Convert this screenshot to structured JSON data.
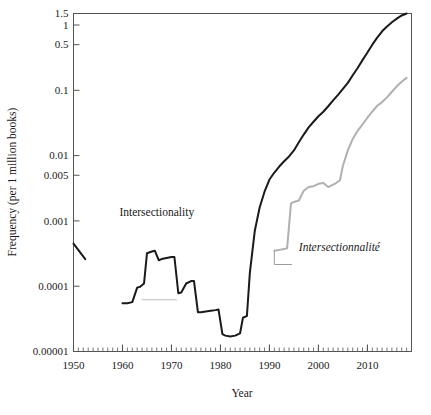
{
  "chart_data": {
    "type": "line",
    "title": "",
    "subtitle": "",
    "xlabel": "Year",
    "ylabel": "Frequency (per 1 million books)",
    "yscale": "log",
    "xlim": [
      1950,
      2019
    ],
    "ylim": [
      1e-05,
      1.5
    ],
    "grid": false,
    "legend_position": "inline-annotations",
    "xticks": [
      "1950",
      "1960",
      "1970",
      "1980",
      "1990",
      "2000",
      "2010"
    ],
    "xtick_values": [
      1950,
      1960,
      1970,
      1980,
      1990,
      2000,
      2010
    ],
    "xminor_tick_step": 1,
    "yticks": [
      "1.5",
      "1",
      "0.5",
      "0.1",
      "0.01",
      "0.005",
      "0.001",
      "0.0001",
      "0.00001"
    ],
    "ytick_values": [
      1.5,
      1,
      0.5,
      0.1,
      0.01,
      0.005,
      0.001,
      0.0001,
      1e-05
    ],
    "annotations": [
      {
        "text": "Intersectionality",
        "x": 1967,
        "y": 0.0012,
        "style": "upright",
        "color": "#1a1a1a"
      },
      {
        "text": "Intersectionnalité",
        "x": 1996,
        "y": 0.00035,
        "style": "italic",
        "color": "#1a1a1a"
      }
    ],
    "series": [
      {
        "name": "Intersectionality",
        "color": "#1a1a1a",
        "linewidth": 2.0,
        "segments": [
          {
            "comment": "short early fragment near 1950",
            "x": [
              1950,
              1952.4
            ],
            "values": [
              0.00045,
              0.00026
            ]
          },
          {
            "comment": "main English series",
            "x": [
              1960,
              1961,
              1962,
              1963,
              1963.6,
              1964.4,
              1965,
              1966,
              1966.6,
              1967.4,
              1968,
              1969,
              1970,
              1970.6,
              1971.4,
              1972,
              1973,
              1974,
              1974.6,
              1975.4,
              1976,
              1977,
              1978,
              1979,
              1979.6,
              1980.4,
              1981,
              1982,
              1983,
              1984,
              1984.6,
              1985.4,
              1986,
              1987,
              1988,
              1989,
              1990,
              1991,
              1992,
              1993,
              1994,
              1995,
              1996,
              1997,
              1998,
              1999,
              2000,
              2001,
              2002,
              2003,
              2004,
              2005,
              2006,
              2007,
              2008,
              2009,
              2010,
              2011,
              2012,
              2013,
              2014,
              2015,
              2016,
              2017,
              2018
            ],
            "values": [
              5.5e-05,
              5.5e-05,
              5.7e-05,
              9.5e-05,
              9.8e-05,
              0.00011,
              0.00032,
              0.00034,
              0.00035,
              0.00025,
              0.00026,
              0.00027,
              0.00028,
              0.00028,
              7.8e-05,
              8e-05,
              0.00011,
              0.00012,
              0.00012,
              4e-05,
              4e-05,
              4.1e-05,
              4.2e-05,
              4.3e-05,
              4.4e-05,
              1.85e-05,
              1.75e-05,
              1.7e-05,
              1.75e-05,
              1.9e-05,
              3.3e-05,
              3.5e-05,
              0.00016,
              0.0007,
              0.0016,
              0.0028,
              0.0043,
              0.0055,
              0.0068,
              0.0082,
              0.0097,
              0.012,
              0.016,
              0.021,
              0.027,
              0.033,
              0.04,
              0.047,
              0.057,
              0.07,
              0.085,
              0.105,
              0.13,
              0.17,
              0.22,
              0.29,
              0.38,
              0.5,
              0.64,
              0.8,
              0.95,
              1.1,
              1.25,
              1.4,
              1.5
            ]
          }
        ]
      },
      {
        "name": "Intersectionnalité",
        "color": "#b0b0b0",
        "linewidth": 2.0,
        "segments": [
          {
            "comment": "French series",
            "x": [
              1991,
              1992,
              1993,
              1993.6,
              1994.4,
              1995,
              1996,
              1997,
              1998,
              1999,
              2000,
              2001,
              2002,
              2003,
              2003.6,
              2004.4,
              2005,
              2006,
              2007,
              2008,
              2009,
              2010,
              2011,
              2012,
              2013,
              2014,
              2015,
              2016,
              2017,
              2018
            ],
            "values": [
              0.00035,
              0.00036,
              0.00037,
              0.00038,
              0.00185,
              0.00195,
              0.00205,
              0.0029,
              0.0033,
              0.0034,
              0.0037,
              0.0038,
              0.0033,
              0.0036,
              0.0038,
              0.0042,
              0.007,
              0.012,
              0.018,
              0.024,
              0.03,
              0.038,
              0.047,
              0.058,
              0.066,
              0.078,
              0.095,
              0.115,
              0.135,
              0.155
            ]
          },
          {
            "comment": "faint gray reference line under 1960s peak",
            "x": [
              1964,
              1971
            ],
            "values": [
              6.2e-05,
              6.2e-05
            ],
            "color": "#bdbdbd",
            "linewidth": 1.2
          }
        ]
      }
    ],
    "leader_lines": [
      {
        "comment": "French label leader",
        "points": [
          [
            1991,
            0.00035
          ],
          [
            1991,
            0.000215
          ],
          [
            1994.6,
            0.000215
          ]
        ],
        "color": "#9a9a9a"
      }
    ]
  },
  "axes": {
    "frame_color": "#555555",
    "tick_color": "#555555"
  }
}
